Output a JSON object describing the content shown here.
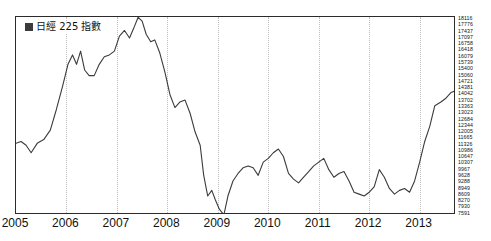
{
  "header": {
    "ghost_left": "",
    "ghost_right": ""
  },
  "legend": {
    "marker_icon": "filled-square-icon",
    "label": "日經 225 指數"
  },
  "chart_data": {
    "type": "line",
    "title": "",
    "xlabel": "",
    "ylabel": "",
    "grid": "vertical-dotted-yearly",
    "legend_position": "top-left-inside",
    "series": [
      {
        "name": "日經 225 指數",
        "color": "#3b3b3b",
        "x": [
          2005.0,
          2005.1,
          2005.2,
          2005.3,
          2005.42,
          2005.55,
          2005.68,
          2005.8,
          2005.92,
          2006.03,
          2006.12,
          2006.2,
          2006.28,
          2006.36,
          2006.45,
          2006.55,
          2006.65,
          2006.75,
          2006.85,
          2006.95,
          2007.05,
          2007.15,
          2007.25,
          2007.33,
          2007.42,
          2007.5,
          2007.58,
          2007.67,
          2007.75,
          2007.85,
          2007.95,
          2008.05,
          2008.15,
          2008.25,
          2008.35,
          2008.45,
          2008.55,
          2008.65,
          2008.72,
          2008.8,
          2008.88,
          2008.95,
          2009.03,
          2009.12,
          2009.2,
          2009.3,
          2009.4,
          2009.5,
          2009.6,
          2009.7,
          2009.8,
          2009.9,
          2010.0,
          2010.1,
          2010.2,
          2010.3,
          2010.4,
          2010.5,
          2010.6,
          2010.7,
          2010.8,
          2010.9,
          2011.0,
          2011.1,
          2011.2,
          2011.3,
          2011.4,
          2011.5,
          2011.6,
          2011.7,
          2011.8,
          2011.9,
          2012.0,
          2012.1,
          2012.2,
          2012.3,
          2012.4,
          2012.5,
          2012.6,
          2012.7,
          2012.8,
          2012.9,
          2013.0,
          2013.1,
          2013.2,
          2013.3,
          2013.42,
          2013.52,
          2013.62,
          2013.72
        ],
        "values": [
          11400,
          11500,
          11300,
          10900,
          11400,
          11600,
          12100,
          13200,
          14400,
          15600,
          16100,
          15600,
          16300,
          15300,
          15000,
          15000,
          15600,
          16000,
          16100,
          16300,
          17100,
          17400,
          17000,
          17500,
          18100,
          17900,
          17200,
          16800,
          16900,
          16200,
          15200,
          14000,
          13300,
          13600,
          13700,
          13000,
          12000,
          11300,
          9700,
          8600,
          8900,
          8400,
          7900,
          7600,
          8600,
          9400,
          9800,
          10100,
          10200,
          10100,
          9700,
          10400,
          10600,
          10900,
          11100,
          10700,
          9800,
          9500,
          9300,
          9600,
          9900,
          10200,
          10400,
          10600,
          10000,
          9600,
          9800,
          9900,
          9400,
          8800,
          8700,
          8600,
          8800,
          9100,
          10000,
          9600,
          9000,
          8700,
          8900,
          9000,
          8800,
          9400,
          10400,
          11500,
          12300,
          13400,
          13600,
          13800,
          14100,
          14200
        ]
      }
    ],
    "xlim": [
      2005.0,
      2013.72
    ],
    "ylim": [
      7591,
      18116
    ],
    "xticks": [
      "2005",
      "2006",
      "2007",
      "2008",
      "2009",
      "2010",
      "2011",
      "2012",
      "2013"
    ],
    "xtick_values": [
      2005,
      2006,
      2007,
      2008,
      2009,
      2010,
      2011,
      2012,
      2013
    ],
    "yticks": [
      "18116",
      "17776",
      "17437",
      "17097",
      "16758",
      "16418",
      "16079",
      "15739",
      "15400",
      "15060",
      "14721",
      "14381",
      "14042",
      "13702",
      "13363",
      "13023",
      "12684",
      "12344",
      "12005",
      "11665",
      "11326",
      "10986",
      "10647",
      "10307",
      "9967",
      "9628",
      "9288",
      "8949",
      "8609",
      "8270",
      "7930",
      "7591"
    ],
    "ytick_side": "right",
    "gridline_years": [
      2006,
      2007,
      2008,
      2009,
      2010,
      2011,
      2012,
      2013
    ]
  }
}
